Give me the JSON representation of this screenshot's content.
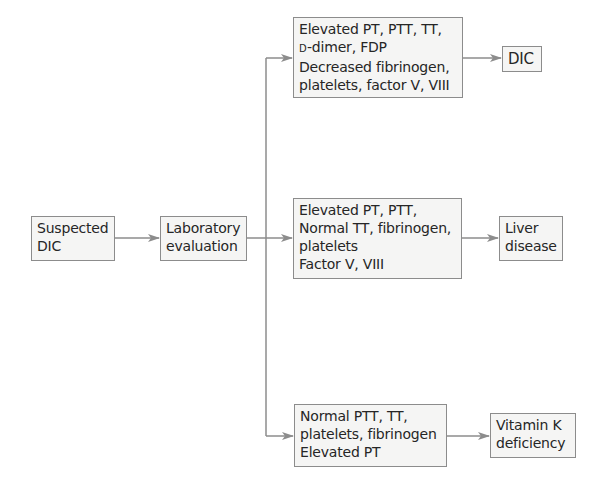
{
  "diagram": {
    "type": "flowchart",
    "stroke_color": "#8c8c8c",
    "box_fill": "#f5f5f4",
    "text_color": "#262626",
    "nodes": {
      "suspected": {
        "lines": [
          "Suspected",
          "DIC"
        ]
      },
      "lab": {
        "lines": [
          "Laboratory",
          "evaluation"
        ]
      },
      "top_findings": {
        "lines": [
          "Elevated PT, PTT, TT,",
          "-dimer, FDP",
          "Decreased fibrinogen,",
          "platelets, factor V, VIII"
        ],
        "dimer_prefix": "D"
      },
      "mid_findings": {
        "lines": [
          "Elevated PT, PTT,",
          "Normal TT, fibrinogen,",
          "platelets",
          "Factor V, VIII"
        ]
      },
      "bot_findings": {
        "lines": [
          "Normal PTT, TT,",
          "platelets, fibrinogen",
          "Elevated PT"
        ]
      },
      "dic": {
        "lines": [
          "DIC"
        ]
      },
      "liver": {
        "lines": [
          "Liver",
          "disease"
        ]
      },
      "vitk": {
        "lines": [
          "Vitamin K",
          "deficiency"
        ]
      }
    },
    "edges": [
      {
        "from": "suspected",
        "to": "lab"
      },
      {
        "from": "lab",
        "to": "top_findings"
      },
      {
        "from": "lab",
        "to": "mid_findings"
      },
      {
        "from": "lab",
        "to": "bot_findings"
      },
      {
        "from": "top_findings",
        "to": "dic"
      },
      {
        "from": "mid_findings",
        "to": "liver"
      },
      {
        "from": "bot_findings",
        "to": "vitk"
      }
    ]
  }
}
